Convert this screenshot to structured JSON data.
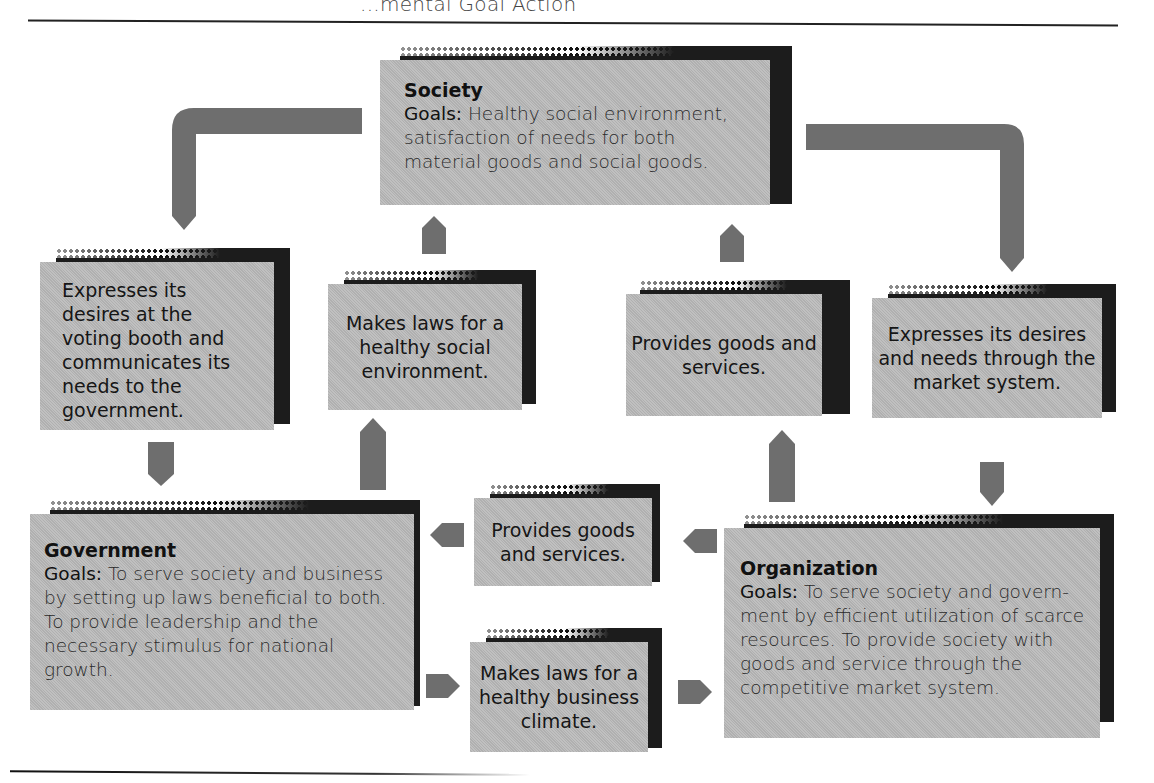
{
  "header": {
    "title": "...mental Goal Action"
  },
  "colors": {
    "box_fill": "#b9b9b9",
    "box_shadow": "#1c1c1c",
    "arrow": "#6e6e6e",
    "rule": "#222222"
  },
  "nodes": {
    "society": {
      "title": "Society",
      "goals_label": "Goals:",
      "goals_text": " Healthy social environment, satisfaction of needs for both material goods and social goods."
    },
    "government": {
      "title": "Government",
      "goals_label": "Goals:",
      "goals_text": " To serve society and business by setting up laws beneficial to both. To provide leadership and the necessary stimulus for national growth."
    },
    "organization": {
      "title": "Organization",
      "goals_label": "Goals:",
      "goals_text": " To serve society and govern-ment by efficient utilization of scarce resources. To provide society with goods and service through the competitive market system."
    }
  },
  "actions": {
    "society_to_government": "Expresses its desires at the voting booth and communicates its needs to the government.",
    "government_to_society": "Makes laws for a healthy social environment.",
    "organization_to_society": "Provides goods and services.",
    "society_to_organization": "Expresses its desires and needs through the market system.",
    "organization_to_government": "Provides goods and services.",
    "government_to_organization": "Makes laws for a healthy business climate."
  },
  "icons": {
    "arrow_up": "arrow-up-icon",
    "arrow_down": "arrow-down-icon",
    "arrow_left": "arrow-left-icon",
    "arrow_right": "arrow-right-icon",
    "elbow_arrow": "elbow-arrow-icon"
  }
}
